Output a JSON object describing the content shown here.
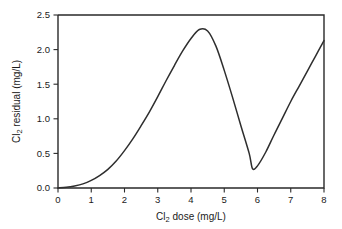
{
  "chart_data": {
    "type": "line",
    "title": "",
    "subtitle": "",
    "xlabel_parts": {
      "pre": "Cl",
      "sub": "2",
      "post": " dose (mg/L)"
    },
    "ylabel_parts": {
      "pre": "Cl",
      "sub": "2",
      "post": " residual (mg/L)"
    },
    "xlabel": "Cl2 dose (mg/L)",
    "ylabel": "Cl2 residual (mg/L)",
    "xlim": [
      0,
      8
    ],
    "ylim": [
      0,
      2.5
    ],
    "xticks": [
      "0",
      "1",
      "2",
      "3",
      "4",
      "5",
      "6",
      "7",
      "8"
    ],
    "xtick_values": [
      0,
      1,
      2,
      3,
      4,
      5,
      6,
      7,
      8
    ],
    "yticks": [
      "0.0",
      "0.5",
      "1.0",
      "1.5",
      "2.0",
      "2.5"
    ],
    "ytick_values": [
      0.0,
      0.5,
      1.0,
      1.5,
      2.0,
      2.5
    ],
    "grid": false,
    "legend": false,
    "legend_position": "none",
    "line_color": "#2e2e2e",
    "axis_color": "#2a2a2a",
    "background_color": "#ffffff",
    "annotations": [],
    "series": [
      {
        "name": "Cl2 residual",
        "x": [
          0.0,
          0.25,
          0.5,
          0.75,
          1.0,
          1.25,
          1.5,
          1.75,
          2.0,
          2.25,
          2.5,
          2.75,
          3.0,
          3.25,
          3.5,
          3.75,
          4.0,
          4.25,
          4.5,
          4.75,
          5.0,
          5.25,
          5.5,
          5.75,
          5.85,
          6.0,
          6.25,
          6.5,
          6.75,
          7.0,
          7.25,
          7.5,
          7.75,
          8.0
        ],
        "y": [
          0.0,
          0.01,
          0.03,
          0.06,
          0.11,
          0.18,
          0.27,
          0.39,
          0.54,
          0.71,
          0.9,
          1.1,
          1.32,
          1.55,
          1.77,
          1.98,
          2.16,
          2.29,
          2.27,
          2.05,
          1.7,
          1.31,
          0.9,
          0.5,
          0.28,
          0.32,
          0.52,
          0.77,
          1.01,
          1.25,
          1.47,
          1.69,
          1.91,
          2.13
        ]
      }
    ]
  },
  "axes": {
    "x_tick_labels": [
      "0",
      "1",
      "2",
      "3",
      "4",
      "5",
      "6",
      "7",
      "8"
    ],
    "y_tick_labels": [
      "0.0",
      "0.5",
      "1.0",
      "1.5",
      "2.0",
      "2.5"
    ]
  }
}
